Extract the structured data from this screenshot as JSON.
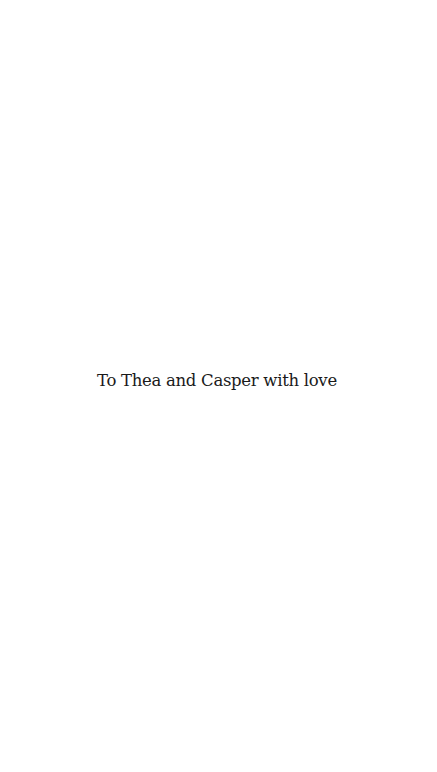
{
  "page": {
    "dedication": "To Thea and Casper with love"
  }
}
